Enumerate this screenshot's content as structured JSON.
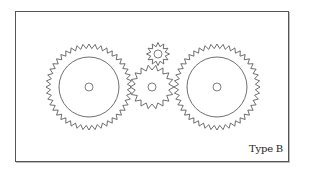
{
  "figure": {
    "caption": "Type B",
    "stroke_color": "#4a4a4a",
    "frame_color": "#555555",
    "background": "#ffffff"
  },
  "gears": [
    {
      "name": "left-large-gear",
      "cx": 89,
      "cy": 87,
      "outer_r": 43,
      "root_r": 38.5,
      "teeth": 44,
      "inner_circle_r": 30,
      "hole_r": 4
    },
    {
      "name": "center-gear",
      "cx": 152,
      "cy": 87,
      "outer_r": 22,
      "root_r": 17,
      "teeth": 18,
      "inner_circle_r": 0,
      "hole_r": 4
    },
    {
      "name": "small-top-gear",
      "cx": 158,
      "cy": 54,
      "outer_r": 11.5,
      "root_r": 7.5,
      "teeth": 12,
      "inner_circle_r": 0,
      "hole_r": 4
    },
    {
      "name": "right-large-gear",
      "cx": 217,
      "cy": 87,
      "outer_r": 43,
      "root_r": 38.5,
      "teeth": 44,
      "inner_circle_r": 30,
      "hole_r": 4
    }
  ]
}
